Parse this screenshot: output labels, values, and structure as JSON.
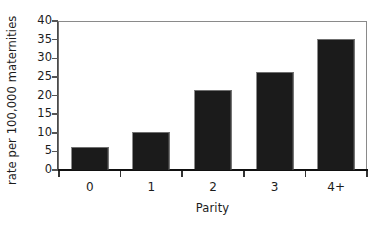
{
  "chart_data": {
    "type": "bar",
    "title": "",
    "subtitle": "",
    "xlabel": "Parity",
    "ylabel": "rate per 100,000 maternities",
    "categories": [
      "0",
      "1",
      "2",
      "3",
      "4+"
    ],
    "values": [
      6.2,
      10.3,
      21.6,
      26.3,
      35.1
    ],
    "series": [
      {
        "name": "rate per 100,000 maternities",
        "values": [
          6.2,
          10.3,
          21.6,
          26.3,
          35.1
        ]
      }
    ],
    "ylim": [
      0,
      40
    ],
    "ytick_labels": [
      "0",
      "5",
      "10",
      "15",
      "20",
      "25",
      "30",
      "35",
      "40"
    ],
    "ytick_values": [
      0,
      5,
      10,
      15,
      20,
      25,
      30,
      35,
      40
    ],
    "grid": false,
    "legend": null,
    "legend_position": "none",
    "annotations": [],
    "colors": {
      "bar_fill": "#1b1b1b",
      "bar_edge": "#6f6f6f",
      "axis_line": "#111111",
      "frame_line": "#8a8a8a",
      "text": "#1c1c1c",
      "background": "#ffffff"
    }
  }
}
